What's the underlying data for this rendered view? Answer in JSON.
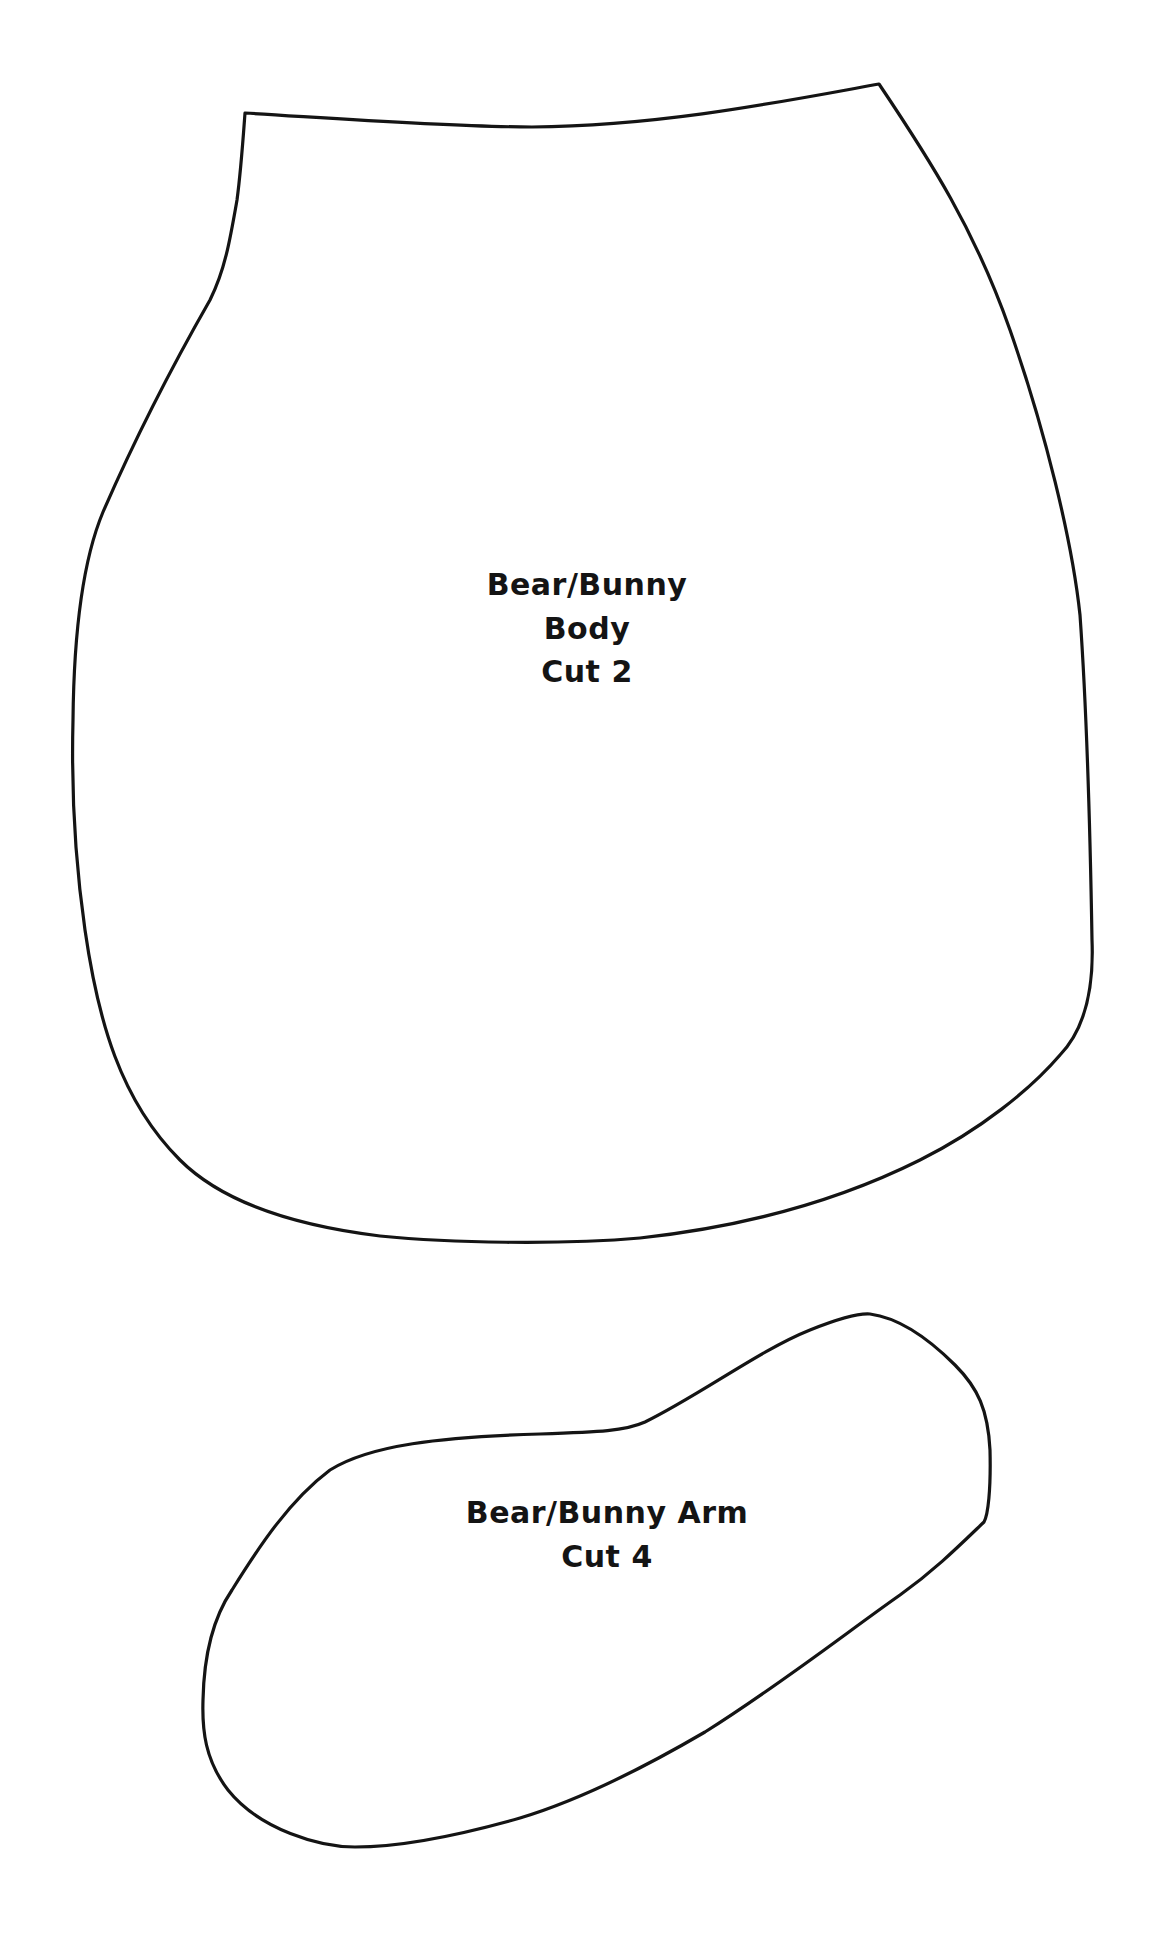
{
  "pattern_pieces": [
    {
      "id": "body",
      "lines": [
        "Bear/Bunny",
        "Body",
        "Cut 2"
      ]
    },
    {
      "id": "arm",
      "lines": [
        "Bear/Bunny Arm",
        "Cut 4"
      ]
    }
  ],
  "colors": {
    "background": "#ffffff",
    "outline": "#141414",
    "text": "#141414"
  }
}
